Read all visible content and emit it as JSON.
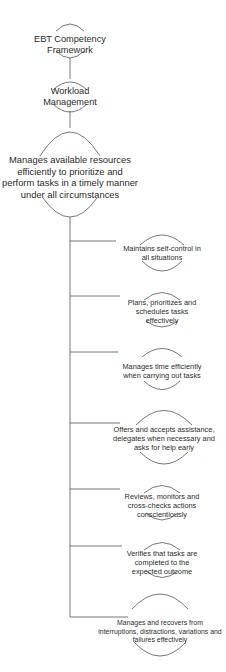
{
  "diagram": {
    "type": "hierarchy-tree",
    "root": {
      "label_lines": [
        "EBT Competency",
        "Framework"
      ]
    },
    "competency": {
      "label_lines": [
        "Workload",
        "Management"
      ]
    },
    "description": {
      "label_lines": [
        "Manages available resources",
        "efficiently to prioritize and",
        "perform tasks in a timely manner",
        "under all circumstances"
      ]
    },
    "behaviours": [
      {
        "label_lines": [
          "Maintains self-control in",
          "all situations"
        ]
      },
      {
        "label_lines": [
          "Plans, prioritizes and",
          "schedules tasks",
          "effectively"
        ]
      },
      {
        "label_lines": [
          "Manages time efficiently",
          "when carrying out tasks"
        ]
      },
      {
        "label_lines": [
          "Offers and accepts assistance,",
          "delegates when necessary and",
          "asks for help early"
        ]
      },
      {
        "label_lines": [
          "Reviews, monitors and",
          "cross-checks actions",
          "conscientiously"
        ]
      },
      {
        "label_lines": [
          "Verifies that tasks are",
          "completed to the",
          "expected outcome"
        ]
      },
      {
        "label_lines": [
          "Manages and recovers from",
          "interruptions, distractions, variations and",
          "failures effectively"
        ]
      }
    ],
    "colors": {
      "line": "#555555",
      "text": "#2b2b2b",
      "background": "#ffffff"
    }
  }
}
